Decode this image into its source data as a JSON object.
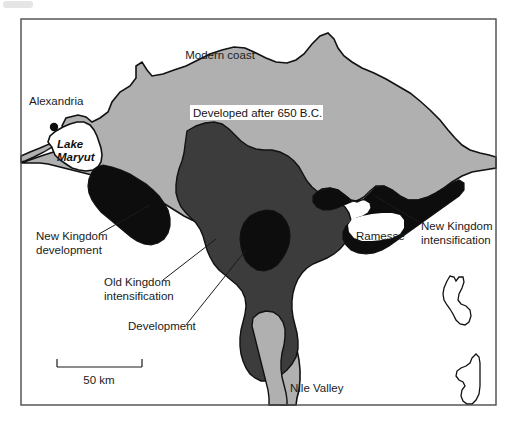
{
  "figure": {
    "kind": "thematic-map",
    "title_visible": false,
    "region_name": "Nile Delta",
    "frame": {
      "x": 21,
      "y": 19,
      "width": 475,
      "height": 386,
      "stroke": "#4a4a4a"
    },
    "background": "#ffffff"
  },
  "palette": {
    "light_gray_fill": "#b0b0b0",
    "mid_dark_fill": "#3c3c3c",
    "black_fill": "#0d0d0d",
    "white_fill": "#ffffff",
    "outline": "#111111",
    "text": "#1b1b1b",
    "frame": "#4a4a4a"
  },
  "legend_regions": [
    {
      "key": "developed_after_650bc",
      "label": "Developed after 650 B.C.",
      "shade": "#b0b0b0",
      "boxed_label": true
    },
    {
      "key": "old_kingdom_intensification",
      "label": "Old Kingdom intensification",
      "shade": "#3c3c3c",
      "boxed_label": false
    },
    {
      "key": "new_kingdom_development",
      "label": "New Kingdom development",
      "shade": "#0d0d0d",
      "boxed_label": false
    },
    {
      "key": "new_kingdom_intensification",
      "label": "New Kingdom intensification",
      "shade": "#0d0d0d",
      "boxed_label": false
    },
    {
      "key": "development",
      "label": "Development",
      "shade": "#0d0d0d",
      "boxed_label": false
    }
  ],
  "labels": {
    "modern_coast": "Modern coast",
    "alexandria": "Alexandria",
    "lake_maryut_line1": "Lake",
    "lake_maryut_line2": "Maryut",
    "developed_after": "Developed after 650 B.C.",
    "new_kingdom_dev_line1": "New Kingdom",
    "new_kingdom_dev_line2": "development",
    "old_kingdom_int_line1": "Old Kingdom",
    "old_kingdom_int_line2": "intensification",
    "development": "Development",
    "ramesse": "Ramesse",
    "new_kingdom_int_line1": "New Kingdom",
    "new_kingdom_int_line2": "intensification",
    "nile_valley": "Nile Valley"
  },
  "scale_bar": {
    "label": "50 km",
    "length_px": 85,
    "tick_length_px": 7,
    "x": 57,
    "y": 367
  },
  "annotation_leaders": [
    {
      "for": "new_kingdom_development",
      "from": [
        99,
        234
      ],
      "to": [
        150,
        205
      ]
    },
    {
      "for": "old_kingdom_intensification",
      "from": [
        163,
        280
      ],
      "to": [
        216,
        239
      ]
    },
    {
      "for": "development",
      "from": [
        186,
        325
      ],
      "to": [
        246,
        250
      ]
    },
    {
      "for": "new_kingdom_intensification",
      "from": [
        419,
        222
      ],
      "to": [
        375,
        196
      ]
    }
  ]
}
